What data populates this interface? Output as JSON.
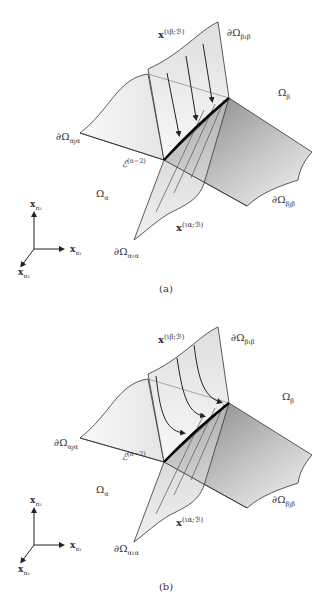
{
  "figure": {
    "panels": [
      {
        "id": "a",
        "caption": "(a)",
        "labels": {
          "x_beta": "x",
          "x_beta_sup": "(ιβ;ℬ)",
          "boundary_beta_top": "∂Ω",
          "boundary_beta_top_sub": "βιβ",
          "omega_beta": "Ω",
          "omega_beta_sub": "β",
          "boundary_alpha_left": "∂Ω",
          "boundary_alpha_left_sub": "αȷα",
          "edge_label": "ℰ",
          "edge_label_sup": "(n−2)",
          "omega_alpha": "Ω",
          "omega_alpha_sub": "α",
          "boundary_beta_bottom": "∂Ω",
          "boundary_beta_bottom_sub": "βȷβ",
          "x_alpha": "x",
          "x_alpha_sup": "(ια;ℬ)",
          "boundary_alpha_bottom": "∂Ω",
          "boundary_alpha_bottom_sub": "αια",
          "axis_n2": "x",
          "axis_n2_sub": "n₂",
          "axis_n1": "x",
          "axis_n1_sub": "n₁",
          "axis_n3": "x",
          "axis_n3_sub": "n₃"
        },
        "arrow_style": "straight"
      },
      {
        "id": "b",
        "caption": "(b)",
        "labels": {
          "x_beta": "x",
          "x_beta_sup": "(ιβ;ℬ)",
          "boundary_beta_top": "∂Ω",
          "boundary_beta_top_sub": "βιβ",
          "omega_beta": "Ω",
          "omega_beta_sub": "β",
          "boundary_alpha_left": "∂Ω",
          "boundary_alpha_left_sub": "αȷα",
          "edge_label": "ℰ",
          "edge_label_sup": "(n−2)",
          "omega_alpha": "Ω",
          "omega_alpha_sub": "α",
          "boundary_beta_bottom": "∂Ω",
          "boundary_beta_bottom_sub": "βȷβ",
          "x_alpha": "x",
          "x_alpha_sup": "(ια;ℬ)",
          "boundary_alpha_bottom": "∂Ω",
          "boundary_alpha_bottom_sub": "αια",
          "axis_n2": "x",
          "axis_n2_sub": "n₂",
          "axis_n1": "x",
          "axis_n1_sub": "n₁",
          "axis_n3": "x",
          "axis_n3_sub": "n₃"
        },
        "arrow_style": "curved"
      }
    ],
    "colors": {
      "line": "#333333",
      "edge": "#000000",
      "surface_light": "#f2f2f2",
      "surface_dark": "#8a8a8a"
    }
  }
}
